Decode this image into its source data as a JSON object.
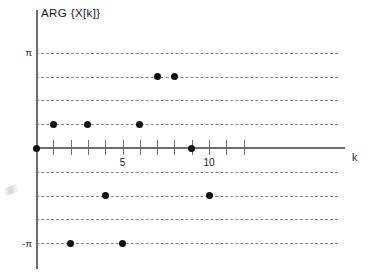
{
  "figure": {
    "width": 379,
    "height": 280,
    "background": "#ffffff",
    "ink_color": "#111111",
    "axis_color": "#6d6d6d",
    "grid_color": "#8a8a8a"
  },
  "labels": {
    "y_axis_title": "ARG {X[k]}",
    "x_axis_title": "k",
    "y_tick_positive": "π",
    "y_tick_negative": "-π",
    "x_tick_5": "5",
    "x_tick_10": "10"
  },
  "chart_data": {
    "type": "scatter",
    "title": "ARG {X[k]}",
    "xlabel": "k",
    "ylabel": "ARG {X[k]}",
    "xlim": [
      -0.4,
      13.6
    ],
    "ylim": [
      -4.25,
      4.25
    ],
    "grid": true,
    "legend": false,
    "x_ticks": [
      1,
      2,
      3,
      4,
      5,
      6,
      7,
      8,
      9,
      10,
      11,
      12
    ],
    "x_tick_labels": [
      "",
      "",
      "",
      "",
      "5",
      "",
      "",
      "",
      "",
      "10",
      "",
      ""
    ],
    "y_ticks": [
      -3.1416,
      -2.3562,
      -1.5708,
      -0.7854,
      0.7854,
      1.5708,
      2.3562,
      3.1416
    ],
    "y_tick_labels": [
      "-π",
      "",
      "",
      "",
      "",
      "",
      "",
      "π"
    ],
    "gridlines_y": [
      3.1416,
      2.3562,
      1.5708,
      0.7854,
      -0.7854,
      -1.5708,
      -2.3562,
      -3.1416
    ],
    "x": [
      0,
      1,
      2,
      3,
      4,
      5,
      6,
      7,
      8,
      9,
      10,
      11
    ],
    "values": [
      0.0,
      0.7854,
      -3.1416,
      0.7854,
      -1.5708,
      -3.1416,
      0.7854,
      2.3562,
      0.0,
      2.3562,
      -1.5708,
      0.0
    ],
    "points": [
      {
        "k": 0,
        "y": 0.0,
        "y_label": "0"
      },
      {
        "k": 1,
        "y": 0.7854,
        "y_label": "π/4"
      },
      {
        "k": 2,
        "y": -3.1416,
        "y_label": "-π"
      },
      {
        "k": 3,
        "y": 0.7854,
        "y_label": "π/4"
      },
      {
        "k": 4,
        "y": -1.5708,
        "y_label": "-π/2"
      },
      {
        "k": 5,
        "y": -3.1416,
        "y_label": "-π"
      },
      {
        "k": 6,
        "y": 0.7854,
        "y_label": "π/4"
      },
      {
        "k": 7,
        "y": 2.3562,
        "y_label": "3π/4"
      },
      {
        "k": 8,
        "y": 2.3562,
        "y_label": "3π/4"
      },
      {
        "k": 9,
        "y": 0.0,
        "y_label": "0"
      },
      {
        "k": 10,
        "y": -1.5708,
        "y_label": "-π/2"
      }
    ]
  },
  "geometry": {
    "origin_x": 36,
    "origin_y": 148,
    "x_step": 17.3,
    "y_step": 23.75,
    "grid_right": 338,
    "axis_right": 345
  }
}
